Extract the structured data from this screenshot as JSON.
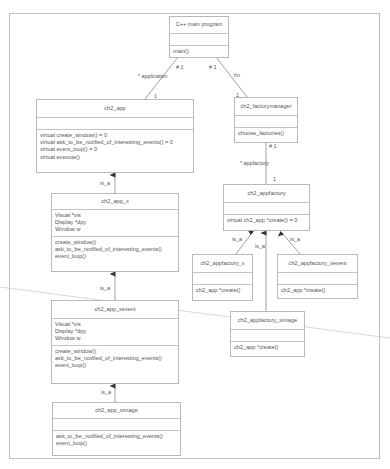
{
  "diagram": {
    "type": "UML class diagram",
    "classes": {
      "main": {
        "name": "C++ main program",
        "attributes": [],
        "operations": [
          "main()"
        ]
      },
      "app": {
        "name": "ch2_app",
        "attributes": [],
        "operations": [
          "virtual create_window() = 0",
          "virtual ask_to_be_notified_of_interesting_events() = 0",
          "virtual event_loop() = 0",
          "virtual execute()"
        ]
      },
      "factorymanager": {
        "name": "ch2_factorymanager",
        "attributes": [],
        "operations": [
          "choose_factories()"
        ]
      },
      "appfactory": {
        "name": "ch2_appfactory",
        "attributes": [],
        "operations": [
          "virtual ch2_app *create() = 0"
        ]
      },
      "app_x": {
        "name": "ch2_app_x",
        "attributes": [
          "Visual *vis",
          "Display *dpy",
          "Window w"
        ],
        "operations": [
          "create_window()",
          "ask_to_be_notified_of_interesting_events()",
          "event_loop()"
        ]
      },
      "appfactory_x": {
        "name": "ch2_appfactory_x",
        "attributes": [],
        "operations": [
          "ch2_app *create()"
        ]
      },
      "appfactory_xevent": {
        "name": "ch2_appfactory_xevent",
        "attributes": [],
        "operations": [
          "ch2_app *create()"
        ]
      },
      "appfactory_ximage": {
        "name": "ch2_appfactory_ximage",
        "attributes": [],
        "operations": [
          "ch2_app *create()"
        ]
      },
      "app_xevent": {
        "name": "ch2_app_xevent",
        "attributes": [
          "Visual *vis",
          "Display *dpy",
          "Window w"
        ],
        "operations": [
          "create_window()",
          "ask_to_be_notified_of_interesting_events()",
          "event_loop()"
        ]
      },
      "app_ximage": {
        "name": "ch2_app_ximage",
        "attributes": [],
        "operations": [
          "ask_to_be_notified_of_interesting_events()",
          "event_loop()"
        ]
      }
    },
    "labels": {
      "main_app_mult_src": "# 1",
      "main_app_role": "* application",
      "main_app_mult_dst": "1",
      "main_fm_mult_src": "# 1",
      "main_fm_role": "fm",
      "main_fm_mult_dst": "1",
      "fm_af_mult_src": "# 1",
      "fm_af_role": "* appfactory",
      "fm_af_mult_dst": "1",
      "isa_app_x": "is_a",
      "isa_app_xevent": "is_a",
      "isa_app_ximage": "is_a",
      "isa_af_x": "is_a",
      "isa_af_ximage": "is_a",
      "isa_af_xevent": "is_a"
    }
  }
}
